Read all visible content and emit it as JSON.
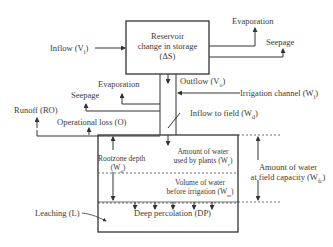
{
  "diagram": {
    "reservoir": {
      "line1": "Reservoir",
      "line2": "change in storage",
      "line3": "(ΔS)"
    },
    "inflow": "Inflow (V",
    "inflow_sub": "i",
    "evaporation_top": "Evaporation",
    "seepage_top": "Seepage",
    "outflow": "Outflow (V",
    "outflow_sub": "o",
    "irrigation_channel": "Irrigation channel (W",
    "irrigation_channel_sub": "i",
    "evaporation_mid": "Evaporation",
    "seepage_mid": "Seepage",
    "runoff": "Runoff (RO)",
    "operational_loss": "Operational loss (O)",
    "inflow_to_field": "Inflow to field (W",
    "inflow_to_field_sub": "d",
    "rootzone_line1": "Rootzone depth",
    "rootzone_line2": "(W",
    "rootzone_sub": "d",
    "used_by_plants_line1": "Amount of water",
    "used_by_plants_line2": "used by plants (W",
    "used_by_plants_sub": "c",
    "before_irrigation_line1": "Volume of water",
    "before_irrigation_line2": "before irrigation (W",
    "before_irrigation_sub": "m",
    "field_capacity_line1": "Amount of water",
    "field_capacity_line2": "at field capacity (W",
    "field_capacity_sub": "fc",
    "leaching": "Leaching (L)",
    "deep_percolation": "Deep percolation (DP)"
  }
}
